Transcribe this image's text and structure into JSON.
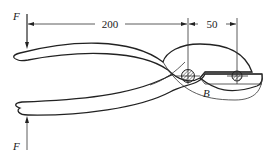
{
  "diagram": {
    "labels": {
      "force_top": "F",
      "force_bottom": "F",
      "pin_label": "B"
    },
    "dimensions": {
      "handle_length": "200",
      "jaw_length": "50"
    },
    "colors": {
      "line": "#222222",
      "background": "#ffffff",
      "hatch": "#444444"
    }
  }
}
